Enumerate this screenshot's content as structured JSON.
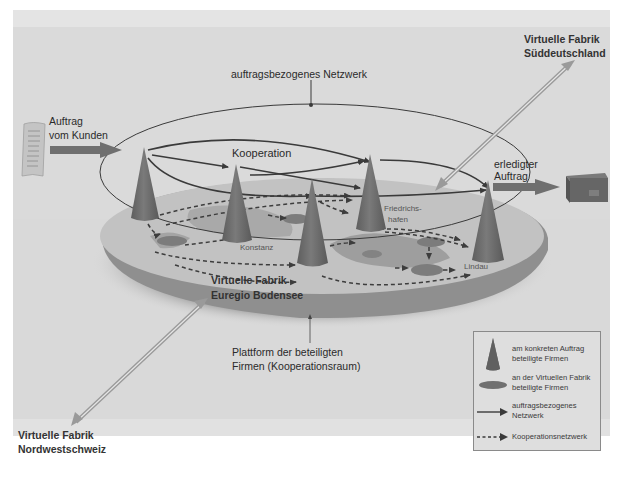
{
  "diagram": {
    "colors": {
      "background": "#dadada",
      "frame_top_band": "#e4e4e4",
      "platform_top": "#c4c4c4",
      "platform_side": "#8d8d8d",
      "cone": "#6c6c6c",
      "disc": "#7c7c7c",
      "network_arrow": "#3a3a3a",
      "cooperation_arrow": "#3a3a3a",
      "input_arrow": "#707070",
      "link_arrow": "#a8a8a8"
    },
    "labels": {
      "network_title": "auftragsbezogenes Netzwerk",
      "cooperation": "Kooperation",
      "order_in_line1": "Auftrag",
      "order_in_line2": "vom Kunden",
      "order_out_line1": "erledigter",
      "order_out_line2": "Auftrag",
      "vf_south_line1": "Virtuelle Fabrik",
      "vf_south_line2": "Süddeutschland",
      "vf_euregio_line1": "Virtuelle Fabrik",
      "vf_euregio_line2": "Euregio Bodensee",
      "vf_northwest_line1": "Virtuelle Fabrik",
      "vf_northwest_line2": "Nordwestschweiz",
      "platform_line1": "Plattform der beteiligten",
      "platform_line2": "Firmen (Kooperationsraum)"
    },
    "cities": [
      {
        "name": "Konstanz"
      },
      {
        "name_line1": "Friedrichs-",
        "name_line2": "hafen"
      },
      {
        "name": "Lindau"
      }
    ],
    "icons": {
      "order_document": "document-icon",
      "finished_product": "box-icon"
    },
    "legend": {
      "items": [
        {
          "symbol": "cone",
          "line1": "am konkreten Auftrag",
          "line2": "beteiligte Firmen"
        },
        {
          "symbol": "disc",
          "line1": "an der Virtuellen Fabrik",
          "line2": "beteiligte Firmen"
        },
        {
          "symbol": "solid-arrow",
          "line1": "auftragsbezogenes",
          "line2": "Netzwerk"
        },
        {
          "symbol": "dashed-arrow",
          "line1": "Kooperationsnetzwerk",
          "line2": ""
        }
      ]
    }
  }
}
